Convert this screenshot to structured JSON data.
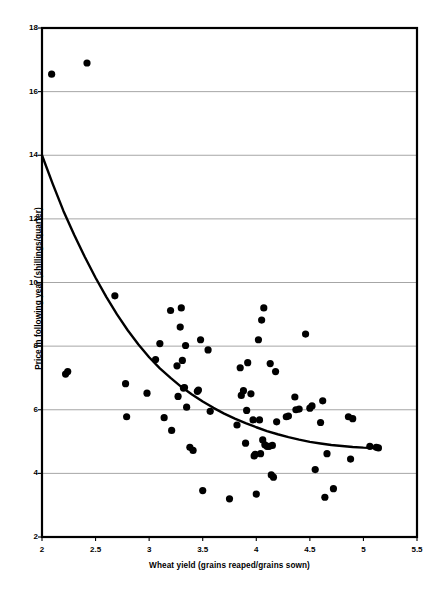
{
  "chart_data": {
    "type": "scatter",
    "title": "",
    "xlabel": "Wheat yield (grains reaped/grains sown)",
    "ylabel": "Price in following year (shillings/quarter)",
    "xlim": [
      2,
      5.5
    ],
    "ylim": [
      2,
      18
    ],
    "xticks": [
      "2",
      "2.5",
      "3",
      "3.5",
      "4",
      "4.5",
      "5",
      "5.5"
    ],
    "xtick_values": [
      2,
      2.5,
      3,
      3.5,
      4,
      4.5,
      5,
      5.5
    ],
    "yticks": [
      "2",
      "4",
      "6",
      "8",
      "10",
      "12",
      "14",
      "16",
      "18"
    ],
    "ytick_values": [
      2,
      4,
      6,
      8,
      10,
      12,
      14,
      16,
      18
    ],
    "grid": "horizontal",
    "grid_color": "#808080",
    "legend": "none",
    "marker_color": "#000000",
    "marker_shape": "circle",
    "marker_size": 3.6,
    "border_color": "#000000",
    "points": [
      [
        2.09,
        16.55
      ],
      [
        2.42,
        16.9
      ],
      [
        2.22,
        7.12
      ],
      [
        2.24,
        7.2
      ],
      [
        2.68,
        9.58
      ],
      [
        2.78,
        6.82
      ],
      [
        2.79,
        5.78
      ],
      [
        2.98,
        6.52
      ],
      [
        3.06,
        7.58
      ],
      [
        3.1,
        8.08
      ],
      [
        3.14,
        5.75
      ],
      [
        3.2,
        9.12
      ],
      [
        3.21,
        5.35
      ],
      [
        3.26,
        7.38
      ],
      [
        3.27,
        6.42
      ],
      [
        3.29,
        8.6
      ],
      [
        3.3,
        9.2
      ],
      [
        3.31,
        7.55
      ],
      [
        3.32,
        6.68
      ],
      [
        3.33,
        6.7
      ],
      [
        3.34,
        8.02
      ],
      [
        3.35,
        6.08
      ],
      [
        3.38,
        4.82
      ],
      [
        3.41,
        4.72
      ],
      [
        3.45,
        6.58
      ],
      [
        3.46,
        6.62
      ],
      [
        3.48,
        8.2
      ],
      [
        3.5,
        3.46
      ],
      [
        3.55,
        7.88
      ],
      [
        3.57,
        5.95
      ],
      [
        3.75,
        3.2
      ],
      [
        3.82,
        5.52
      ],
      [
        3.85,
        7.32
      ],
      [
        3.86,
        6.45
      ],
      [
        3.88,
        6.6
      ],
      [
        3.9,
        4.95
      ],
      [
        3.91,
        5.98
      ],
      [
        3.92,
        7.48
      ],
      [
        3.95,
        6.5
      ],
      [
        3.97,
        5.68
      ],
      [
        3.98,
        4.55
      ],
      [
        3.99,
        4.6
      ],
      [
        4.0,
        3.35
      ],
      [
        4.02,
        8.2
      ],
      [
        4.03,
        5.68
      ],
      [
        4.04,
        4.62
      ],
      [
        4.05,
        8.82
      ],
      [
        4.06,
        5.05
      ],
      [
        4.07,
        9.2
      ],
      [
        4.08,
        4.9
      ],
      [
        4.1,
        4.85
      ],
      [
        4.12,
        4.85
      ],
      [
        4.13,
        7.45
      ],
      [
        4.14,
        3.95
      ],
      [
        4.15,
        4.88
      ],
      [
        4.16,
        3.88
      ],
      [
        4.18,
        7.2
      ],
      [
        4.19,
        5.62
      ],
      [
        4.28,
        5.78
      ],
      [
        4.3,
        5.8
      ],
      [
        4.36,
        6.4
      ],
      [
        4.37,
        6.0
      ],
      [
        4.4,
        6.02
      ],
      [
        4.46,
        8.38
      ],
      [
        4.5,
        6.05
      ],
      [
        4.52,
        6.12
      ],
      [
        4.55,
        4.12
      ],
      [
        4.6,
        5.6
      ],
      [
        4.62,
        6.28
      ],
      [
        4.64,
        3.25
      ],
      [
        4.66,
        4.62
      ],
      [
        4.72,
        3.52
      ],
      [
        4.86,
        5.78
      ],
      [
        4.88,
        4.45
      ],
      [
        4.9,
        5.72
      ],
      [
        5.06,
        4.85
      ],
      [
        5.12,
        4.82
      ],
      [
        5.14,
        4.8
      ]
    ],
    "fit_curve": {
      "label": "fitted trend",
      "color": "#000000",
      "line_width": 2.4,
      "x": [
        2.0,
        2.1,
        2.2,
        2.3,
        2.4,
        2.5,
        2.6,
        2.7,
        2.8,
        2.9,
        3.0,
        3.1,
        3.2,
        3.3,
        3.4,
        3.5,
        3.6,
        3.7,
        3.8,
        3.9,
        4.0,
        4.1,
        4.2,
        4.3,
        4.4,
        4.5,
        4.6,
        4.7,
        4.8,
        4.9,
        5.0,
        5.1,
        5.15
      ],
      "y": [
        14.0,
        13.1,
        12.25,
        11.5,
        10.8,
        10.15,
        9.55,
        9.0,
        8.5,
        8.05,
        7.65,
        7.3,
        7.0,
        6.72,
        6.48,
        6.26,
        6.06,
        5.88,
        5.72,
        5.58,
        5.45,
        5.33,
        5.23,
        5.14,
        5.06,
        4.99,
        4.94,
        4.89,
        4.86,
        4.83,
        4.81,
        4.8,
        4.8
      ]
    }
  }
}
